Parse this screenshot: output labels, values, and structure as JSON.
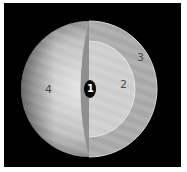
{
  "diagram": {
    "type": "planet-interior-cutaway",
    "colors": {
      "background": "#000000",
      "border": "#ffffff",
      "outer_surface": "#c8c8c8",
      "layer_3": "#a9a9a9",
      "layer_2": "#cfcfcf",
      "core": "#050505"
    },
    "labels": [
      {
        "id": "1",
        "text": "1",
        "region": "core"
      },
      {
        "id": "2",
        "text": "2",
        "region": "inner-layer"
      },
      {
        "id": "3",
        "text": "3",
        "region": "outer-layer"
      },
      {
        "id": "4",
        "text": "4",
        "region": "surface"
      }
    ]
  }
}
